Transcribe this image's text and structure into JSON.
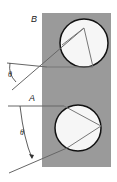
{
  "diagram": {
    "labels": {
      "top": "B",
      "bottom": "A",
      "angle_top": "θ",
      "angle_bottom": "θ"
    },
    "colors": {
      "background": "#ffffff",
      "slab": "#9a9a9a",
      "circle_fill": "#f6f6f6",
      "circle_stroke": "#111111",
      "ray": "#555555",
      "chord": "#7a7a7a"
    }
  }
}
